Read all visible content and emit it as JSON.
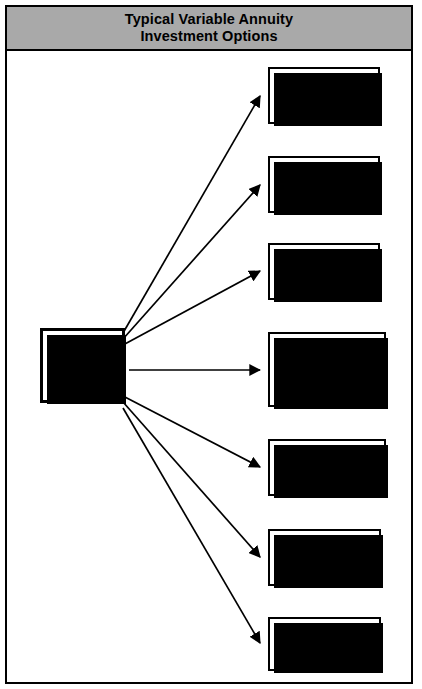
{
  "figure": {
    "title": "Typical Variable Annuity\nInvestment Options",
    "title_line1": "Typical Variable Annuity",
    "title_line2": "Investment Options",
    "title_band_color": "#a9a9a9",
    "frame_color": "#000000",
    "background_color": "#ffffff"
  },
  "source_node": {
    "label": "Variable\nAnnuity\nPremium\nDollars",
    "lines": [
      "Variable",
      "Annuity",
      "Premium",
      "Dollars"
    ]
  },
  "option_nodes": [
    {
      "id": "money-market-fund",
      "label": "Money\nMarket\nFund",
      "lines": [
        "Money",
        "Market",
        "Fund"
      ]
    },
    {
      "id": "government-securities-fund",
      "label": "Government\nSecurities\nFund",
      "lines": [
        "Government",
        "Securities",
        "Fund"
      ]
    },
    {
      "id": "bond-fund",
      "label": "Bond\nFund",
      "lines": [
        "Bond",
        "Fund"
      ]
    },
    {
      "id": "total-return-balanced-fund",
      "label": "Total\nReturn\n(Balanced)\nFund",
      "lines": [
        "Total",
        "Return",
        "(Balanced)",
        "Fund"
      ]
    },
    {
      "id": "growth-common-stock-fund",
      "label": "Growth\n(Common Stock)\nFund",
      "lines": [
        "Growth",
        "(Common Stock)",
        "Fund"
      ]
    },
    {
      "id": "growth-with-income-stock-fund",
      "label": "Growth with\nIncome (Stock)\nFund",
      "lines": [
        "Growth with",
        "Income (Stock)",
        "Fund"
      ]
    },
    {
      "id": "guaranteed-account",
      "label": "Guaranteed\nAccount",
      "lines": [
        "Guaranteed",
        "Account"
      ]
    }
  ],
  "connections": [
    {
      "from": "variable-annuity-premium-dollars",
      "to": "money-market-fund"
    },
    {
      "from": "variable-annuity-premium-dollars",
      "to": "government-securities-fund"
    },
    {
      "from": "variable-annuity-premium-dollars",
      "to": "bond-fund"
    },
    {
      "from": "variable-annuity-premium-dollars",
      "to": "total-return-balanced-fund"
    },
    {
      "from": "variable-annuity-premium-dollars",
      "to": "growth-common-stock-fund"
    },
    {
      "from": "variable-annuity-premium-dollars",
      "to": "growth-with-income-stock-fund"
    },
    {
      "from": "variable-annuity-premium-dollars",
      "to": "guaranteed-account"
    }
  ]
}
